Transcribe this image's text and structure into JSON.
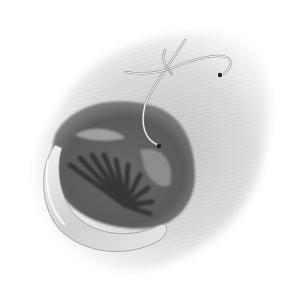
{
  "illustration": {
    "subject": "surgical illustration of opening with radial folds and suture",
    "colors": {
      "background": "#ffffff",
      "tissue_light": "#e6e6e6",
      "tissue_mid": "#b5b5b5",
      "cavity_dark": "#5a5a5a",
      "folds_dark": "#3a3a3a",
      "retractor": "#d8d8d8",
      "suture": "#f2f2f2",
      "needle_tip": "#222222"
    },
    "elements": [
      {
        "name": "outer-tissue-region"
      },
      {
        "name": "cavity-opening"
      },
      {
        "name": "radial-folds"
      },
      {
        "name": "retractor-blade"
      },
      {
        "name": "suture-thread"
      },
      {
        "name": "needle-points",
        "count": 2
      }
    ]
  }
}
